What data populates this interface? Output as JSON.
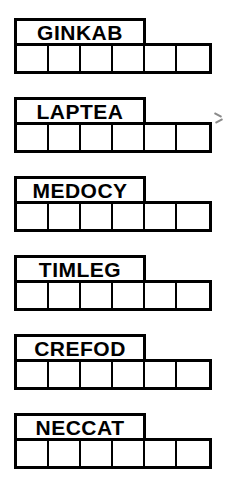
{
  "worksheet": {
    "kind": "word-puzzle-grid",
    "cells_per_row": 6,
    "label_span_cells": 4,
    "ink_color": "#000000",
    "paper_color": "#ffffff",
    "groups": [
      {
        "label": "GINKAB",
        "circled_cells": [
          6
        ],
        "cells": [
          "",
          "",
          "",
          "",
          "",
          ""
        ]
      },
      {
        "label": "LAPTEA",
        "circled_cells": [
          2,
          4
        ],
        "cells": [
          "",
          "",
          "",
          "",
          "",
          ""
        ]
      },
      {
        "label": "MEDOCY",
        "circled_cells": [
          2,
          4
        ],
        "cells": [
          "",
          "",
          "",
          "",
          "",
          ""
        ]
      },
      {
        "label": "TIMLEG",
        "circled_cells": [
          3
        ],
        "cells": [
          "",
          "",
          "",
          "",
          "",
          ""
        ]
      },
      {
        "label": "CREFOD",
        "circled_cells": [
          2,
          4
        ],
        "cells": [
          "",
          "",
          "",
          "",
          "",
          ""
        ]
      },
      {
        "label": "NECCAT",
        "circled_cells": [
          2,
          3
        ],
        "cells": [
          "",
          "",
          "",
          "",
          "",
          ""
        ]
      }
    ]
  }
}
